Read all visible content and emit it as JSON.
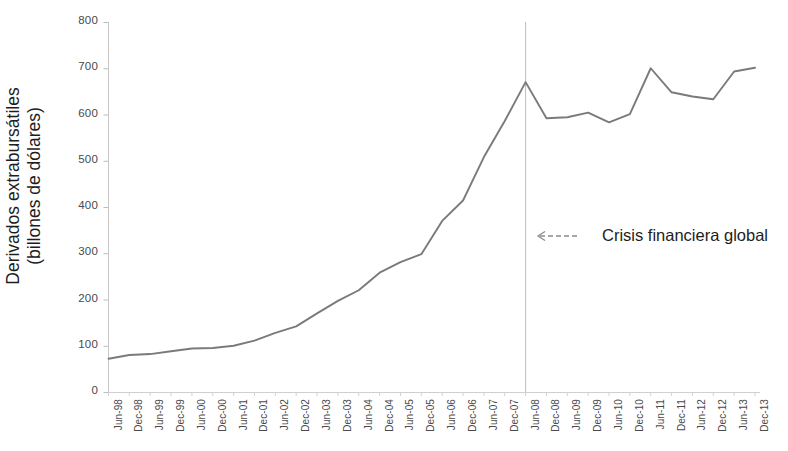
{
  "chart_data": {
    "type": "line",
    "title": "",
    "xlabel": "",
    "ylabel": "Derivados extrabursátiles (billones de dólares)",
    "ylabel_line1": "Derivados extrabursátiles",
    "ylabel_line2": "(billones de dólares)",
    "ylim": [
      0,
      800
    ],
    "ytick_labels": [
      "800",
      "700",
      "600",
      "500",
      "400",
      "300",
      "200",
      "100",
      "0"
    ],
    "ytick_values": [
      800,
      700,
      600,
      500,
      400,
      300,
      200,
      100,
      0
    ],
    "grid": false,
    "legend": "none",
    "line_color": "#7a7a7a",
    "categories": [
      "Jun-98",
      "Dec-98",
      "Jun-99",
      "Dec-99",
      "Jun-00",
      "Dec-00",
      "Jun-01",
      "Dec-01",
      "Jun-02",
      "Dec-02",
      "Jun-03",
      "Dec-03",
      "Jun-04",
      "Dec-04",
      "Jun-05",
      "Dec-05",
      "Jun-06",
      "Dec-06",
      "Jun-07",
      "Dec-07",
      "Jun-08",
      "Dec-08",
      "Jun-09",
      "Dec-09",
      "Jun-10",
      "Dec-10",
      "Jun-11",
      "Dec-11",
      "Jun-12",
      "Dec-12",
      "Jun-13",
      "Dec-13"
    ],
    "values": [
      72,
      80,
      82,
      88,
      94,
      95,
      100,
      111,
      128,
      142,
      170,
      197,
      220,
      258,
      281,
      298,
      370,
      414,
      508,
      586,
      670,
      592,
      594,
      604,
      583,
      601,
      700,
      648,
      639,
      633,
      693,
      701
    ],
    "annotations": [
      {
        "text": "Crisis financiera global",
        "target_category": "Jun-08",
        "marker": "vertical-line-with-left-arrow"
      }
    ]
  },
  "axis": {
    "crisis_marker_label": "Crisis financiera global"
  }
}
